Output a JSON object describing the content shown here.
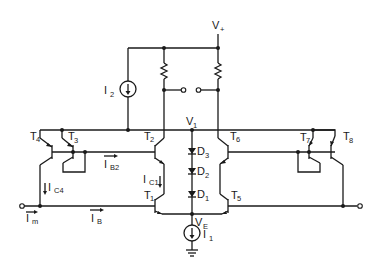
{
  "diagram": {
    "type": "circuit-schematic",
    "supply": {
      "label": "V",
      "sub": "+"
    },
    "nodes": {
      "v1": {
        "label": "V",
        "sub": "1"
      },
      "ve": {
        "label": "V",
        "sub": "E"
      }
    },
    "current_sources": [
      {
        "id": "I2",
        "label": "I",
        "sub": "2"
      },
      {
        "id": "I1",
        "label": "I",
        "sub": "1"
      }
    ],
    "transistors": [
      {
        "id": "T1",
        "label": "T",
        "sub": "1"
      },
      {
        "id": "T2",
        "label": "T",
        "sub": "2"
      },
      {
        "id": "T3",
        "label": "T",
        "sub": "3"
      },
      {
        "id": "T4",
        "label": "T",
        "sub": "4"
      },
      {
        "id": "T5",
        "label": "T",
        "sub": "5"
      },
      {
        "id": "T6",
        "label": "T",
        "sub": "6"
      },
      {
        "id": "T7",
        "label": "T",
        "sub": "7"
      },
      {
        "id": "T8",
        "label": "T",
        "sub": "8"
      }
    ],
    "diodes": [
      {
        "id": "D3",
        "label": "D",
        "sub": "3"
      },
      {
        "id": "D2",
        "label": "D",
        "sub": "2"
      },
      {
        "id": "D1",
        "label": "D",
        "sub": "1"
      }
    ],
    "currents": {
      "ib2": {
        "label": "I",
        "sub": "B2"
      },
      "ic1": {
        "label": "I",
        "sub": "C1"
      },
      "ic4": {
        "label": "I",
        "sub": "C4"
      },
      "im": {
        "label": "I",
        "sub": "m"
      },
      "ib": {
        "label": "I",
        "sub": "B"
      }
    },
    "resistors": [
      "R-left",
      "R-right"
    ],
    "terminals": [
      "input-left",
      "output-right",
      "output-switch-left",
      "output-switch-right"
    ]
  }
}
